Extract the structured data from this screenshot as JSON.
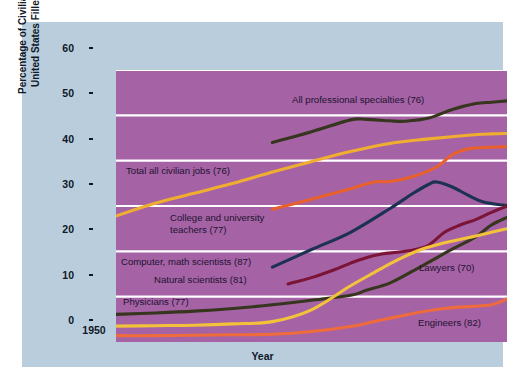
{
  "figure": {
    "background_color": "#ffffff",
    "frame_color": "#b9cddc",
    "plot_background_color": "#a563a6",
    "gridline_color": "#ffffff"
  },
  "axes": {
    "xlabel": "Year",
    "ylabel": "Percentage of Civilian Jobs in the\nUnited States Filled by Women",
    "ylabel_line1": "Percentage of Civilian Jobs in the",
    "ylabel_line2": "United States Filled by Women",
    "xticks": [
      "1950",
      "1960",
      "1970",
      "1980",
      "1990",
      "2000"
    ],
    "yticks": [
      "0",
      "10",
      "20",
      "30",
      "40",
      "50",
      "60"
    ]
  },
  "annotations": [
    {
      "id": "all-professional-specialties",
      "text": "All professional specialties (76)",
      "x": 270,
      "y": 72
    },
    {
      "id": "total-all-civilian-jobs",
      "text": "Total all civilian jobs (76)",
      "x": 104,
      "y": 143
    },
    {
      "id": "college-and-university-teachers",
      "text": "College and university\nteachers (77)",
      "x": 148,
      "y": 190
    },
    {
      "id": "computer-math-scientists",
      "text": "Computer, math scientists (87)",
      "x": 99,
      "y": 234
    },
    {
      "id": "natural-scientists",
      "text": "Natural scientists (81)",
      "x": 132,
      "y": 252
    },
    {
      "id": "physicians",
      "text": "Physicians (77)",
      "x": 101,
      "y": 274
    },
    {
      "id": "lawyers",
      "text": "Lawyers (70)",
      "x": 397,
      "y": 240
    },
    {
      "id": "engineers",
      "text": "Engineers (82)",
      "x": 396,
      "y": 295
    }
  ],
  "chart_data": {
    "type": "line",
    "title": "",
    "xlabel": "Year",
    "ylabel": "Percentage of Civilian Jobs in the United States Filled by Women",
    "xlim": [
      1950,
      2000
    ],
    "ylim": [
      0,
      60
    ],
    "xticks": [
      1950,
      1960,
      1970,
      1980,
      1990,
      2000
    ],
    "yticks": [
      0,
      10,
      20,
      30,
      40,
      50,
      60
    ],
    "grid": "horizontal",
    "legend": "inline-annotations",
    "series": [
      {
        "name": "All professional specialties (76)",
        "color": "#36351d",
        "x": [
          1970,
          1975,
          1980,
          1982,
          1985,
          1987,
          1990,
          1993,
          1996,
          1998,
          2000
        ],
        "y": [
          44.0,
          46.4,
          49.0,
          49.1,
          48.8,
          48.7,
          49.4,
          51.3,
          52.6,
          52.9,
          53.2
        ]
      },
      {
        "name": "Total all civilian jobs (76)",
        "color": "#f0ae31",
        "x": [
          1950,
          1955,
          1960,
          1965,
          1970,
          1975,
          1980,
          1985,
          1990,
          1995,
          1998,
          2000
        ],
        "y": [
          27.8,
          30.6,
          32.8,
          35.0,
          37.5,
          39.8,
          42.0,
          43.8,
          44.8,
          45.6,
          45.9,
          46.0
        ]
      },
      {
        "name": "College and university teachers (77)",
        "color": "#e8612c",
        "x": [
          1970,
          1975,
          1980,
          1983,
          1985,
          1988,
          1991,
          1993,
          1995,
          1997,
          2000
        ],
        "y": [
          29.3,
          31.5,
          33.8,
          35.3,
          35.4,
          36.5,
          38.6,
          41.3,
          42.6,
          42.9,
          43.1
        ]
      },
      {
        "name": "Computer, math scientists (87)",
        "color": "#1d3252",
        "x": [
          1970,
          1975,
          1980,
          1985,
          1988,
          1990,
          1991,
          1993,
          1995,
          1997,
          2000
        ],
        "y": [
          16.5,
          20.4,
          24.2,
          29.4,
          32.8,
          34.8,
          35.3,
          34.2,
          32.4,
          30.9,
          30.1
        ]
      },
      {
        "name": "Natural scientists (81)",
        "color": "#7b1437",
        "x": [
          1972,
          1975,
          1978,
          1980,
          1982,
          1984,
          1986,
          1988,
          1990,
          1992,
          1994,
          1996,
          1998,
          2000
        ],
        "y": [
          12.8,
          14.2,
          16.0,
          17.4,
          18.6,
          19.4,
          19.8,
          20.3,
          21.4,
          24.2,
          25.8,
          27.0,
          28.6,
          30.0
        ]
      },
      {
        "name": "Physicians (77)",
        "color": "#36351d",
        "x": [
          1950,
          1955,
          1960,
          1965,
          1970,
          1975,
          1980,
          1982,
          1985,
          1988,
          1990,
          1993,
          1996,
          1998,
          2000
        ],
        "y": [
          6.1,
          6.4,
          6.8,
          7.4,
          8.2,
          9.2,
          10.3,
          11.4,
          13.0,
          15.7,
          17.6,
          20.5,
          23.2,
          25.8,
          27.5
        ]
      },
      {
        "name": "Lawyers (70)",
        "color": "#f2c23b",
        "x": [
          1950,
          1955,
          1960,
          1965,
          1970,
          1975,
          1980,
          1983,
          1986,
          1989,
          1992,
          1995,
          1998,
          2000
        ],
        "y": [
          3.5,
          3.6,
          3.7,
          4.0,
          4.5,
          7.1,
          12.4,
          15.3,
          18.1,
          20.4,
          21.9,
          23.0,
          24.2,
          25.0
        ]
      },
      {
        "name": "Engineers (82)",
        "color": "#ee6b3b",
        "x": [
          1950,
          1955,
          1960,
          1965,
          1970,
          1975,
          1980,
          1983,
          1986,
          1989,
          1992,
          1995,
          1998,
          2000
        ],
        "y": [
          1.4,
          1.4,
          1.5,
          1.6,
          1.7,
          2.3,
          3.4,
          4.5,
          5.6,
          6.6,
          7.4,
          7.8,
          8.2,
          9.5
        ]
      }
    ]
  }
}
